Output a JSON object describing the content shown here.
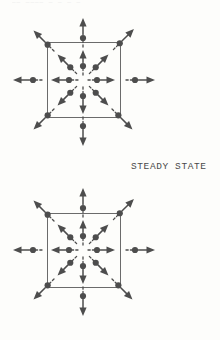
{
  "page": {
    "background_color": "#fdfdfb",
    "ink_color": "#4d4d4d",
    "width": 220,
    "height": 340,
    "top_cropped_text": "——  ————  — — — —"
  },
  "labels": {
    "steady_state": "STEADY STATE"
  },
  "chart_data": {
    "type": "scatter",
    "title": "",
    "subtitle": "",
    "xlabel": "",
    "ylabel": "",
    "grid": false,
    "legend_position": "none",
    "annotations": [
      "STEADY STATE"
    ],
    "panels": [
      {
        "name": "upper-panel",
        "box": {
          "x": 47,
          "y": 42,
          "width": 73,
          "height": 75,
          "stroke": "#6b6b6b",
          "fill": "none"
        },
        "center": {
          "x": 83,
          "y": 80
        },
        "particles": [
          {
            "angle": -90,
            "r_dot": 14,
            "r_tip": 30,
            "inside": true
          },
          {
            "angle": -90,
            "r_dot": 42,
            "r_tip": 62,
            "inside": false
          },
          {
            "angle": -45,
            "r_dot": 18,
            "r_tip": 36,
            "inside": true
          },
          {
            "angle": -45,
            "r_dot": 52,
            "r_tip": 72,
            "inside": false
          },
          {
            "angle": -135,
            "r_dot": 18,
            "r_tip": 36,
            "inside": true
          },
          {
            "angle": -135,
            "r_dot": 50,
            "r_tip": 70,
            "inside": false
          },
          {
            "angle": 0,
            "r_dot": 14,
            "r_tip": 32,
            "inside": true
          },
          {
            "angle": 0,
            "r_dot": 52,
            "r_tip": 72,
            "inside": false
          },
          {
            "angle": 180,
            "r_dot": 14,
            "r_tip": 32,
            "inside": true
          },
          {
            "angle": 180,
            "r_dot": 50,
            "r_tip": 70,
            "inside": false
          },
          {
            "angle": 45,
            "r_dot": 18,
            "r_tip": 36,
            "inside": true
          },
          {
            "angle": 45,
            "r_dot": 50,
            "r_tip": 70,
            "inside": false
          },
          {
            "angle": 135,
            "r_dot": 18,
            "r_tip": 36,
            "inside": true
          },
          {
            "angle": 135,
            "r_dot": 50,
            "r_tip": 70,
            "inside": false
          },
          {
            "angle": 90,
            "r_dot": 16,
            "r_tip": 34,
            "inside": true
          },
          {
            "angle": 90,
            "r_dot": 46,
            "r_tip": 66,
            "inside": false
          }
        ]
      },
      {
        "name": "lower-panel",
        "box": {
          "x": 47,
          "y": 213,
          "width": 73,
          "height": 74,
          "stroke": "#6b6b6b",
          "fill": "none"
        },
        "center": {
          "x": 83,
          "y": 250
        },
        "particles": [
          {
            "angle": -90,
            "r_dot": 14,
            "r_tip": 30,
            "inside": true
          },
          {
            "angle": -90,
            "r_dot": 42,
            "r_tip": 62,
            "inside": false
          },
          {
            "angle": -45,
            "r_dot": 18,
            "r_tip": 36,
            "inside": true
          },
          {
            "angle": -45,
            "r_dot": 52,
            "r_tip": 72,
            "inside": false
          },
          {
            "angle": -135,
            "r_dot": 18,
            "r_tip": 36,
            "inside": true
          },
          {
            "angle": -135,
            "r_dot": 50,
            "r_tip": 70,
            "inside": false
          },
          {
            "angle": 0,
            "r_dot": 14,
            "r_tip": 32,
            "inside": true
          },
          {
            "angle": 0,
            "r_dot": 52,
            "r_tip": 72,
            "inside": false
          },
          {
            "angle": 180,
            "r_dot": 14,
            "r_tip": 32,
            "inside": true
          },
          {
            "angle": 180,
            "r_dot": 50,
            "r_tip": 70,
            "inside": false
          },
          {
            "angle": 45,
            "r_dot": 18,
            "r_tip": 36,
            "inside": true
          },
          {
            "angle": 45,
            "r_dot": 50,
            "r_tip": 70,
            "inside": false
          },
          {
            "angle": 135,
            "r_dot": 18,
            "r_tip": 36,
            "inside": true
          },
          {
            "angle": 135,
            "r_dot": 50,
            "r_tip": 70,
            "inside": false
          },
          {
            "angle": 90,
            "r_dot": 16,
            "r_tip": 34,
            "inside": true
          },
          {
            "angle": 90,
            "r_dot": 46,
            "r_tip": 66,
            "inside": false
          }
        ]
      }
    ]
  }
}
